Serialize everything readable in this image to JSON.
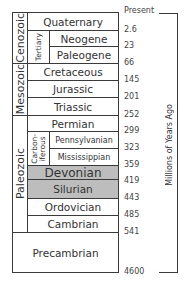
{
  "eras": [
    {
      "name": "Cenozoic"
    },
    {
      "name": "Mesozoic"
    },
    {
      "name": "Paleozoic"
    }
  ],
  "subperiods": [
    {
      "name": "Tertiary"
    },
    {
      "name": "Carbon-\niferous"
    }
  ],
  "periods": [
    {
      "name": "Quaternary"
    },
    {
      "name": "Neogene"
    },
    {
      "name": "Paleogene"
    },
    {
      "name": "Cretaceous"
    },
    {
      "name": "Jurassic"
    },
    {
      "name": "Triassic"
    },
    {
      "name": "Permian"
    },
    {
      "name": "Pennsylvanian"
    },
    {
      "name": "Mississippian"
    },
    {
      "name": "Devonian",
      "highlight": true
    },
    {
      "name": "Silurian",
      "highlight": true
    },
    {
      "name": "Ordovician"
    },
    {
      "name": "Cambrian"
    },
    {
      "name": "Precambrian"
    }
  ],
  "ages": [
    "Present",
    "2.6",
    "23",
    "66",
    "145",
    "201",
    "252",
    "299",
    "323",
    "359",
    "419",
    "443",
    "485",
    "541",
    "4600"
  ],
  "axis_label": "Millions of Years Ago",
  "colors": {
    "highlight": "#bdbdbd",
    "border": "#3a3a3a"
  }
}
